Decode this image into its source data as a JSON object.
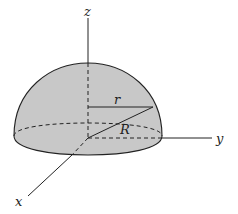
{
  "diagram": {
    "labels": {
      "z_axis": "z",
      "y_axis": "y",
      "x_axis": "x",
      "slice_radius": "r",
      "sphere_radius": "R"
    },
    "colors": {
      "fill": "#c8c8c8",
      "stroke": "#222222",
      "background": "#ffffff"
    }
  }
}
